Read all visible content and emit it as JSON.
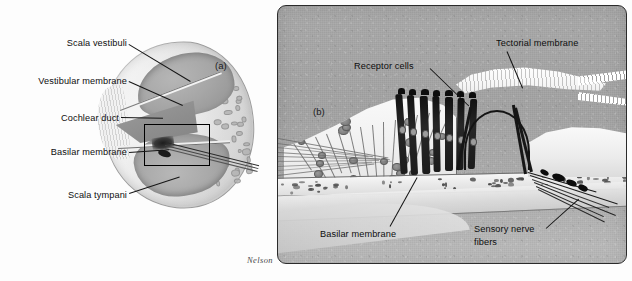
{
  "figure": {
    "attribution": "Nelson",
    "background_color": "#ffffff"
  },
  "panel_a": {
    "tag": "(a)",
    "description": "Cross-section through one turn of the cochlea",
    "labels": [
      {
        "id": "scala-vestibuli",
        "text": "Scala vestibuli"
      },
      {
        "id": "vestibular-membrane",
        "text": "Vestibular membrane"
      },
      {
        "id": "cochlear-duct",
        "text": "Cochlear duct"
      },
      {
        "id": "basilar-membrane",
        "text": "Basilar membrane"
      },
      {
        "id": "scala-tympani",
        "text": "Scala tympani"
      }
    ],
    "inset_marker": "magnified-region-box"
  },
  "panel_b": {
    "tag": "(b)",
    "description": "Magnified view of the organ of Corti",
    "border_color": "#2b2b2b",
    "background_color": "#a9a9a9",
    "labels": [
      {
        "id": "receptor-cells",
        "text": "Receptor cells",
        "lines": [
          "Receptor cells"
        ]
      },
      {
        "id": "tectorial-membrane",
        "text": "Tectorial membrane",
        "lines": [
          "Tectorial membrane"
        ]
      },
      {
        "id": "basilar-membrane",
        "text": "Basilar membrane",
        "lines": [
          "Basilar membrane"
        ]
      },
      {
        "id": "sensory-nerve-fibers",
        "text": "Sensory nerve fibers",
        "lines": [
          "Sensory nerve",
          "fibers"
        ]
      }
    ]
  }
}
